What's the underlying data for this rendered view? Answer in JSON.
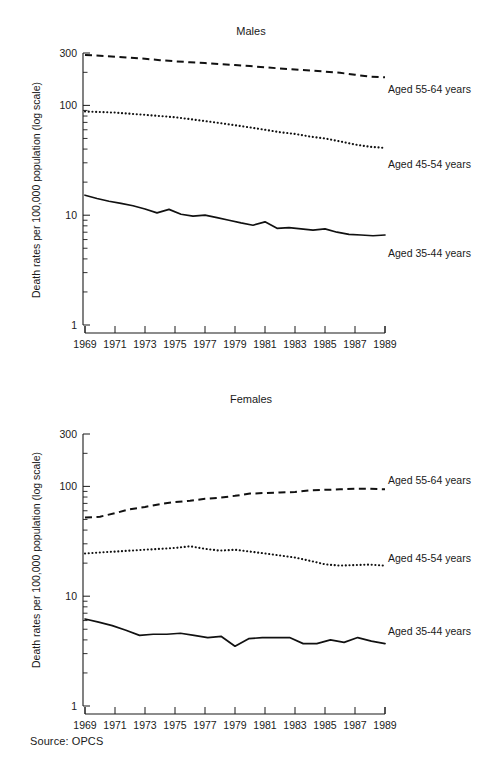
{
  "source_note": "Source: OPCS",
  "axis": {
    "ylabel": "Death rates per 100,000 population (log scale)",
    "yticks": [
      "300",
      "100",
      "10",
      "1"
    ],
    "ytick_values": [
      300,
      100,
      10,
      1
    ],
    "ylim": [
      1,
      300
    ],
    "xticks": [
      "1969",
      "1971",
      "1973",
      "1975",
      "1977",
      "1979",
      "1981",
      "1983",
      "1985",
      "1987",
      "1989"
    ],
    "xlim": [
      1969,
      1989
    ],
    "grid": false,
    "legend_position": "right-inline"
  },
  "series_labels": {
    "a5564": "Aged 55-64 years",
    "a4554": "Aged 45-54 years",
    "a3544": "Aged 35-44 years"
  },
  "chart_data": [
    {
      "type": "line",
      "title": "Males",
      "xlabel": "",
      "ylabel": "Death rates per 100,000 population (log scale)",
      "ylim": [
        1,
        300
      ],
      "yscale": "log",
      "grid": false,
      "legend_position": "right-inline",
      "x": [
        1969,
        1970,
        1971,
        1972,
        1973,
        1974,
        1975,
        1976,
        1977,
        1978,
        1979,
        1980,
        1981,
        1982,
        1983,
        1984,
        1985,
        1986,
        1987,
        1988,
        1989
      ],
      "series": [
        {
          "name": "Aged 55-64 years",
          "style": "dashed",
          "values": [
            288,
            283,
            278,
            272,
            266,
            258,
            252,
            247,
            243,
            238,
            233,
            228,
            222,
            217,
            212,
            208,
            203,
            198,
            190,
            183,
            180
          ]
        },
        {
          "name": "Aged 45-54 years",
          "style": "dotted",
          "values": [
            88,
            87,
            86,
            84,
            82,
            80,
            78,
            75,
            72,
            69,
            66,
            63,
            60,
            57,
            55,
            52,
            50,
            47,
            44,
            42,
            41
          ]
        },
        {
          "name": "Aged 35-44 years",
          "style": "solid",
          "values": [
            15.2,
            14.2,
            13.4,
            12.8,
            12.2,
            11.4,
            10.5,
            11.3,
            10.2,
            9.8,
            10.0,
            9.5,
            9.0,
            8.5,
            8.1,
            8.7,
            7.6,
            7.7,
            7.5,
            7.3,
            7.5,
            7.0,
            6.7,
            6.6,
            6.5,
            6.6
          ]
        }
      ]
    },
    {
      "type": "line",
      "title": "Females",
      "xlabel": "",
      "ylabel": "Death rates per 100,000 population (log scale)",
      "ylim": [
        1,
        300
      ],
      "yscale": "log",
      "grid": false,
      "legend_position": "right-inline",
      "x": [
        1969,
        1970,
        1971,
        1972,
        1973,
        1974,
        1975,
        1976,
        1977,
        1978,
        1979,
        1980,
        1981,
        1982,
        1983,
        1984,
        1985,
        1986,
        1987,
        1988,
        1989
      ],
      "series": [
        {
          "name": "Aged 55-64 years",
          "style": "dashed",
          "values": [
            52,
            53,
            57,
            62,
            65,
            69,
            72,
            74,
            77,
            79,
            82,
            86,
            87,
            88,
            89,
            92,
            93,
            94,
            95,
            95,
            94
          ]
        },
        {
          "name": "Aged 45-54 years",
          "style": "dotted",
          "values": [
            24.5,
            25,
            25.5,
            26,
            26.5,
            27,
            27.5,
            28.5,
            27,
            26,
            26.5,
            25.5,
            24.5,
            23.5,
            22.5,
            21,
            19.5,
            19,
            19.2,
            19.4,
            19.0
          ]
        },
        {
          "name": "Aged 35-44 years",
          "style": "solid",
          "values": [
            6.2,
            5.8,
            5.4,
            4.9,
            4.4,
            4.5,
            4.5,
            4.6,
            4.4,
            4.2,
            4.3,
            3.5,
            4.1,
            4.2,
            4.2,
            4.2,
            3.7,
            3.7,
            4.0,
            3.8,
            4.2,
            3.9,
            3.7
          ]
        }
      ]
    }
  ]
}
